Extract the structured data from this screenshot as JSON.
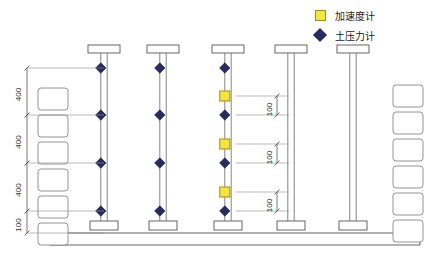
{
  "figure": {
    "title": "",
    "type": "engineering-elevation-diagram",
    "width": 435,
    "height": 259
  },
  "legend": {
    "items": [
      {
        "symbol": "yellow-square",
        "label": "加速度计",
        "color": "#F5E63C",
        "border": "#9a9016"
      },
      {
        "symbol": "navy-diamond",
        "label": "土压力计",
        "color": "#2a2a66"
      }
    ]
  },
  "dimensions": {
    "left_chain": [
      {
        "value": "400",
        "from_y": 68,
        "to_y": 115
      },
      {
        "value": "400",
        "from_y": 115,
        "to_y": 163
      },
      {
        "value": "400",
        "from_y": 163,
        "to_y": 211
      },
      {
        "value": "100",
        "from_y": 211,
        "to_y": 233
      }
    ],
    "inner_chain": [
      {
        "value": "100",
        "from_y": 96,
        "to_y": 115
      },
      {
        "value": "100",
        "from_y": 144,
        "to_y": 163
      },
      {
        "value": "100",
        "from_y": 192,
        "to_y": 211
      }
    ]
  },
  "structure": {
    "slab": {
      "x": 50,
      "y": 233,
      "width": 370,
      "height": 12
    },
    "columns": [
      {
        "id": "column-1",
        "center_x": 104,
        "cap_y": 45,
        "base_y": 221,
        "instrumented": true,
        "accelerometers": false
      },
      {
        "id": "column-2",
        "center_x": 163,
        "cap_y": 45,
        "base_y": 221,
        "instrumented": true,
        "accelerometers": false
      },
      {
        "id": "column-3",
        "center_x": 228,
        "cap_y": 45,
        "base_y": 221,
        "instrumented": true,
        "accelerometers": true
      },
      {
        "id": "column-4",
        "center_x": 291,
        "cap_y": 45,
        "base_y": 221,
        "instrumented": false,
        "accelerometers": false
      },
      {
        "id": "column-5",
        "center_x": 353,
        "cap_y": 45,
        "base_y": 221,
        "instrumented": false,
        "accelerometers": false
      }
    ],
    "sensor_levels_y": [
      68,
      115,
      163,
      211
    ],
    "accelerometer_levels_y": [
      96,
      144,
      192
    ],
    "left_blocks": {
      "x": 38,
      "count": 6,
      "top_y": 88,
      "spacing": 27,
      "width": 30,
      "height": 22
    },
    "right_blocks": {
      "x": 393,
      "count": 6,
      "top_y": 85,
      "spacing": 27,
      "width": 30,
      "height": 22
    }
  }
}
